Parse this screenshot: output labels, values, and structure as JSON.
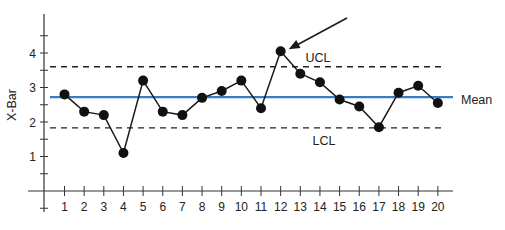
{
  "chart_data": {
    "type": "line",
    "title": "",
    "xlabel": "",
    "ylabel": "X-Bar",
    "x": [
      1,
      2,
      3,
      4,
      5,
      6,
      7,
      8,
      9,
      10,
      11,
      12,
      13,
      14,
      15,
      16,
      17,
      18,
      19,
      20
    ],
    "series": [
      {
        "name": "X-Bar",
        "values": [
          2.8,
          2.3,
          2.2,
          1.1,
          3.2,
          2.3,
          2.2,
          2.7,
          2.9,
          3.2,
          2.4,
          4.05,
          3.4,
          3.15,
          2.65,
          2.45,
          1.85,
          2.85,
          3.05,
          2.55
        ]
      }
    ],
    "reference_lines": [
      {
        "name": "UCL",
        "value": 3.6,
        "style": "dashed",
        "color": "#222222"
      },
      {
        "name": "Mean",
        "value": 2.72,
        "style": "solid",
        "color": "#3b7bc4"
      },
      {
        "name": "LCL",
        "value": 1.83,
        "style": "dashed",
        "color": "#222222"
      }
    ],
    "annotations": [
      {
        "type": "arrow",
        "points_to_x": 12,
        "text": "",
        "meaning": "out-of-control point above UCL"
      }
    ],
    "x_ticks": [
      "1",
      "2",
      "3",
      "4",
      "5",
      "6",
      "7",
      "8",
      "9",
      "10",
      "11",
      "12",
      "13",
      "14",
      "15",
      "16",
      "17",
      "18",
      "19",
      "20"
    ],
    "y_ticks": [
      "1",
      "2",
      "3",
      "4"
    ],
    "ylim": [
      -0.5,
      4.9
    ],
    "xlim": [
      0,
      20.8
    ],
    "grid": false,
    "legend": "none"
  },
  "labels": {
    "ylabel": "X-Bar",
    "ucl": "UCL",
    "lcl": "LCL",
    "mean": "Mean"
  }
}
